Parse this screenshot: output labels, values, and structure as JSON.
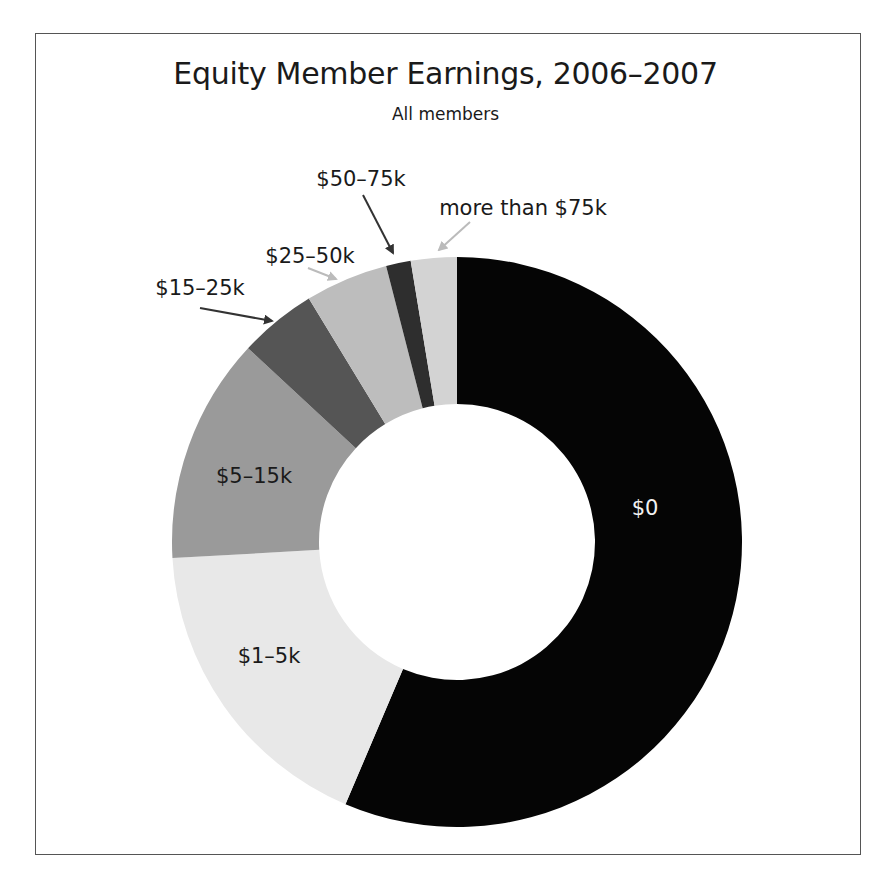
{
  "header": {
    "title": "Equity Member Earnings, 2006–2007",
    "subtitle": "All members"
  },
  "chart_data": {
    "type": "pie",
    "variant": "donut",
    "title": "Equity Member Earnings, 2006–2007",
    "subtitle": "All members",
    "start_angle_deg": 0,
    "direction": "clockwise",
    "categories": [
      "$0",
      "$1–5k",
      "$5–15k",
      "$15–25k",
      "$25–50k",
      "$50–75k",
      "more than $75k"
    ],
    "values": [
      56.4,
      17.7,
      12.8,
      4.4,
      4.7,
      1.4,
      2.6
    ],
    "unit": "percent of members (estimated from slice angles)",
    "colors": [
      "#050505",
      "#e8e8e8",
      "#9a9a9a",
      "#555555",
      "#bdbdbd",
      "#2e2e2e",
      "#d3d3d3"
    ],
    "legend": "none (direct labels)"
  },
  "labels": {
    "zero": "$0",
    "one_five": "$1–5k",
    "five_fifteen": "$5–15k",
    "fifteen_twentyfive": "$15–25k",
    "twentyfive_fifty": "$25–50k",
    "fifty_seventyfive": "$50–75k",
    "over_seventyfive": "more than $75k"
  }
}
